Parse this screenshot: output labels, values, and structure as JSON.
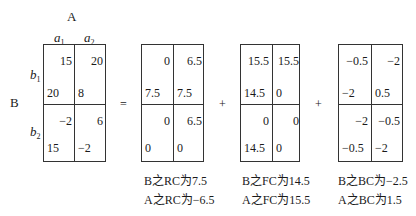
{
  "axes": {
    "col_factor": "A",
    "col_levels": [
      "a",
      "a"
    ],
    "col_level_subs": [
      "1",
      "2"
    ],
    "row_factor": "B",
    "row_levels": [
      "b",
      "b"
    ],
    "row_level_subs": [
      "1",
      "2"
    ]
  },
  "operators": [
    "=",
    "+",
    "+"
  ],
  "matrices": [
    {
      "name": "original",
      "cells": [
        {
          "row": "b1",
          "col": "a1",
          "top_right": "15",
          "bottom_left": "20"
        },
        {
          "row": "b1",
          "col": "a2",
          "top_right": "20",
          "bottom_left": "8"
        },
        {
          "row": "b2",
          "col": "a1",
          "top_right": "−2",
          "bottom_left": "15"
        },
        {
          "row": "b2",
          "col": "a2",
          "top_right": "6",
          "bottom_left": "−2"
        }
      ],
      "captions": []
    },
    {
      "name": "RC",
      "cells": [
        {
          "row": "b1",
          "col": "a1",
          "top_right": "0",
          "bottom_left": "7.5"
        },
        {
          "row": "b1",
          "col": "a2",
          "top_right": "6.5",
          "bottom_left": "7.5"
        },
        {
          "row": "b2",
          "col": "a1",
          "top_right": "0",
          "bottom_left": "0"
        },
        {
          "row": "b2",
          "col": "a2",
          "top_right": "6.5",
          "bottom_left": "0"
        }
      ],
      "captions": [
        "B之RC为7.5",
        "A之RC为−6.5"
      ]
    },
    {
      "name": "FC",
      "cells": [
        {
          "row": "b1",
          "col": "a1",
          "top_right": "15.5",
          "bottom_left": "14.5"
        },
        {
          "row": "b1",
          "col": "a2",
          "top_right": "15.5",
          "bottom_left": "0"
        },
        {
          "row": "b2",
          "col": "a1",
          "top_right": "0",
          "bottom_left": "14.5"
        },
        {
          "row": "b2",
          "col": "a2",
          "top_right": "0",
          "bottom_left": "0"
        }
      ],
      "captions": [
        "B之FC为14.5",
        "A之FC为15.5"
      ]
    },
    {
      "name": "BC",
      "cells": [
        {
          "row": "b1",
          "col": "a1",
          "top_right": "−0.5",
          "bottom_left": "−2"
        },
        {
          "row": "b1",
          "col": "a2",
          "top_right": "−2",
          "bottom_left": "0.5"
        },
        {
          "row": "b2",
          "col": "a1",
          "top_right": "−2",
          "bottom_left": "−0.5"
        },
        {
          "row": "b2",
          "col": "a2",
          "top_right": "−0.5",
          "bottom_left": "−2"
        }
      ],
      "captions": [
        "B之BC为−2.5",
        "A之BC为1.5"
      ]
    }
  ]
}
